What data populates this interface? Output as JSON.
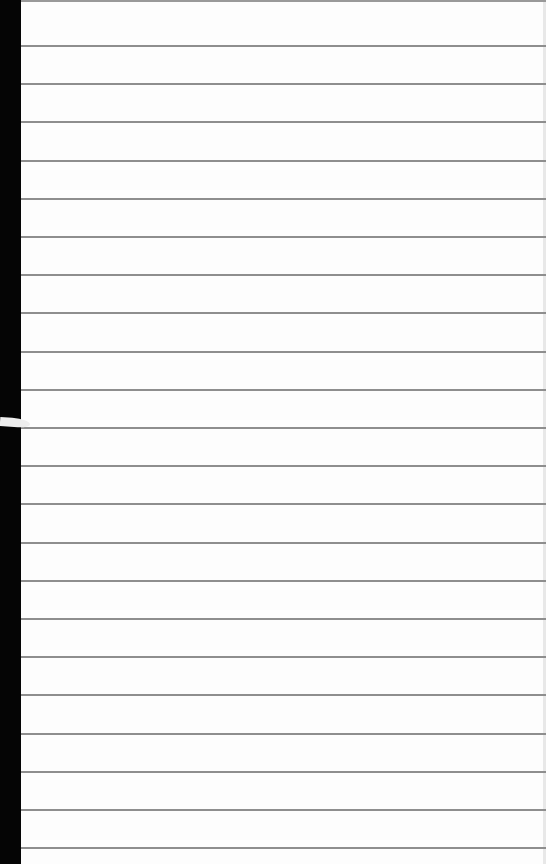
{
  "scene": {
    "description": "Sheet of blank ruled notebook paper on a black background",
    "paper_color": "#fdfdfd",
    "rule_color": "#8e8e8e",
    "background_color": "#000000"
  },
  "rules": {
    "count": 22,
    "first_y": 45,
    "spacing": 38.2
  }
}
